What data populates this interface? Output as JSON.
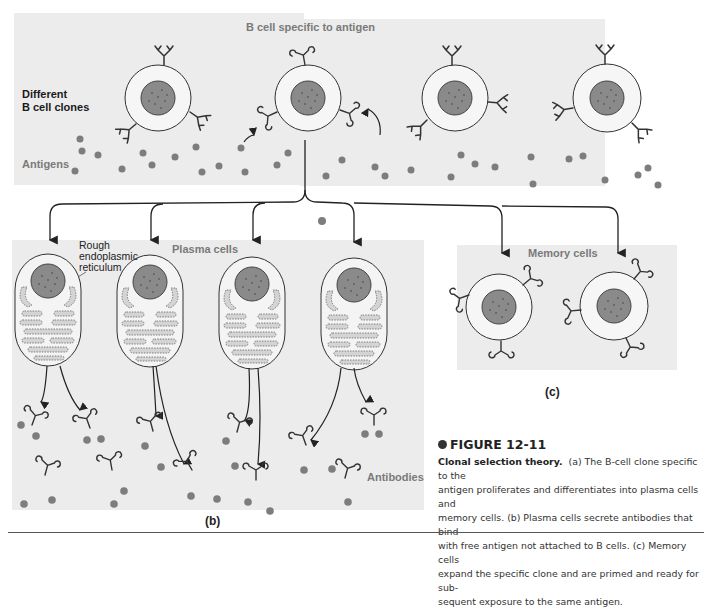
{
  "figure": {
    "number_label": "FIGURE 12-11",
    "title": "Clonal selection theory.",
    "caption": "(a) The B-cell clone specific to the antigen proliferates and differentiates into plasma cells and memory cells. (b) Plasma cells secrete antibodies that bind with free antigen not attached to B cells. (c) Memory cells expand the specific clone and are primed and ready for subsequent exposure to the same antigen.",
    "caption_lines": [
      "(a) The B-cell clone specific to the",
      "antigen proliferates and differentiates into plasma cells and",
      "memory cells. (b) Plasma cells secrete antibodies that bind",
      "with free antigen not attached to B cells. (c) Memory cells",
      "expand the specific clone and are primed and ready for sub-",
      "sequent exposure to the same antigen."
    ]
  },
  "panel_a": {
    "tag": "(a)",
    "labels": {
      "specific_b_cell": "B cell specific to antigen",
      "clones_line1": "Different",
      "clones_line2": "B cell clones",
      "antigens": "Antigens"
    },
    "b_cells": 4
  },
  "panel_b": {
    "tag": "(b)",
    "labels": {
      "plasma_cells": "Plasma cells",
      "rer_line1": "Rough",
      "rer_line2": "endoplasmic",
      "rer_line3": "reticulum",
      "antibodies": "Antibodies"
    },
    "plasma_cells": 4
  },
  "panel_c": {
    "tag": "(c)",
    "labels": {
      "memory_cells": "Memory cells"
    },
    "memory_cells": 2
  },
  "colors": {
    "panel_bg": "#ececec",
    "nucleus": "#8a8a8a",
    "antigen": "#7d7d7d",
    "label_gray": "#7a7a7a",
    "er_fill": "#d6d6d6",
    "line": "#333333"
  }
}
